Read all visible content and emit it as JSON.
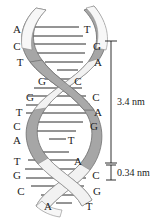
{
  "figure": {
    "background_color": "#ffffff",
    "helix": {
      "ribbon_fill": "#a6a6a6",
      "ribbon_highlight": "#f2f2f2",
      "ribbon_stroke": "#6e6e6e",
      "rung_color": "#2b2b2b"
    },
    "left_strand": {
      "name": "left-strand-bases",
      "bases": [
        {
          "letter": "A",
          "x": 11,
          "y": 24
        },
        {
          "letter": "C",
          "x": 11,
          "y": 41
        },
        {
          "letter": "T",
          "x": 14,
          "y": 57
        },
        {
          "letter": "G",
          "x": 36,
          "y": 76
        },
        {
          "letter": "G",
          "x": 24,
          "y": 92
        },
        {
          "letter": "T",
          "x": 13,
          "y": 107
        },
        {
          "letter": "C",
          "x": 11,
          "y": 121
        },
        {
          "letter": "A",
          "x": 11,
          "y": 135
        },
        {
          "letter": "T",
          "x": 11,
          "y": 156
        },
        {
          "letter": "G",
          "x": 11,
          "y": 170
        },
        {
          "letter": "C",
          "x": 15,
          "y": 186
        },
        {
          "letter": "A",
          "x": 42,
          "y": 201
        }
      ]
    },
    "right_strand": {
      "name": "right-strand-bases",
      "bases": [
        {
          "letter": "T",
          "x": 81,
          "y": 24
        },
        {
          "letter": "G",
          "x": 91,
          "y": 41
        },
        {
          "letter": "A",
          "x": 92,
          "y": 57
        },
        {
          "letter": "C",
          "x": 72,
          "y": 76
        },
        {
          "letter": "C",
          "x": 90,
          "y": 92
        },
        {
          "letter": "A",
          "x": 92,
          "y": 107
        },
        {
          "letter": "G",
          "x": 88,
          "y": 121
        },
        {
          "letter": "T",
          "x": 65,
          "y": 135
        },
        {
          "letter": "A",
          "x": 72,
          "y": 156
        },
        {
          "letter": "C",
          "x": 90,
          "y": 170
        },
        {
          "letter": "G",
          "x": 91,
          "y": 186
        },
        {
          "letter": "T",
          "x": 83,
          "y": 201
        }
      ]
    },
    "measurements": {
      "helix_turn": {
        "name": "helix-turn-measurement",
        "label": "3.4 nm",
        "label_x": 117,
        "label_y": 102,
        "bracket_x": 111,
        "bracket_top": 41,
        "bracket_bottom": 163,
        "cap_half_width": 6
      },
      "base_rise": {
        "name": "base-rise-measurement",
        "label": "0.34 nm",
        "label_x": 117,
        "label_y": 172,
        "bracket_x": 111,
        "bracket_top": 165,
        "bracket_bottom": 180,
        "cap_half_width": 5
      }
    }
  }
}
